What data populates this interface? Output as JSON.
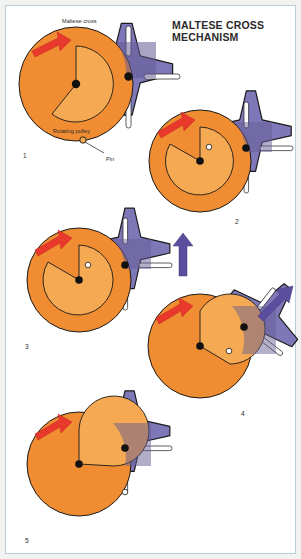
{
  "figure": {
    "title": "MALTESE CROSS MECHANISM",
    "type": "technical-illustration",
    "background_color": "#ffffff",
    "frame_color": "#b9cfd8"
  },
  "palette": {
    "pulley_orange": "#F08C32",
    "pulley_inner_orange": "#F4A952",
    "cross_purple": "#7E78B8",
    "cross_purple_dark": "#655B93",
    "drive_arrow_red": "#E8392C",
    "cross_arrow_purple": "#5B4E9E",
    "outline": "#1a1a1a",
    "slot_white": "#ffffff",
    "text": "#2b2b2b"
  },
  "annotations": {
    "maltese_cross": "Maltese cross",
    "rotating_pulley": "Rotating pulley",
    "pin": "Pin"
  },
  "steps": [
    {
      "number": "1",
      "cross_rotation_deg": 0,
      "pulley_angle_deg": 90,
      "pin_engaged": false,
      "drive_arrow": "red-curved-ccw",
      "cross_arrow": null
    },
    {
      "number": "2",
      "cross_rotation_deg": 0,
      "pulley_angle_deg": 170,
      "pin_engaged": true,
      "drive_arrow": "red-curved-ccw",
      "cross_arrow": null
    },
    {
      "number": "3",
      "cross_rotation_deg": 0,
      "pulley_angle_deg": 178,
      "pin_engaged": true,
      "drive_arrow": "red-curved-ccw",
      "cross_arrow": "purple-up"
    },
    {
      "number": "4",
      "cross_rotation_deg": 38,
      "pulley_angle_deg": 235,
      "pin_engaged": true,
      "drive_arrow": "red-curved-ccw",
      "cross_arrow": "purple-diagonal"
    },
    {
      "number": "5",
      "cross_rotation_deg": 0,
      "pulley_angle_deg": 300,
      "pin_engaged": false,
      "drive_arrow": "red-curved-ccw",
      "cross_arrow": null
    }
  ]
}
